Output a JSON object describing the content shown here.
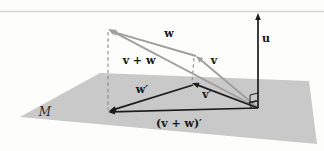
{
  "colors": {
    "background": "#fdfdfc",
    "plane_fill": "#c9c9c9",
    "gray_vector": "#9f9f9f",
    "black_vector": "#1c1c1c",
    "dashed_line": "#8c8c8c",
    "label": "#161616",
    "top_rule": "#d7d4d0"
  },
  "top_rule": {
    "y": 11.5
  },
  "plane": {
    "label": "M",
    "label_pos": [
      45,
      116
    ],
    "corners": [
      [
        20,
        117
      ],
      [
        100,
        73
      ],
      [
        309,
        81
      ],
      [
        317,
        144
      ]
    ]
  },
  "vectors": [
    {
      "id": "v-plus-w",
      "label": "v + w",
      "label_pos": [
        139,
        64
      ],
      "from": [
        258,
        108
      ],
      "to": [
        108,
        29
      ],
      "style": "gray"
    },
    {
      "id": "w",
      "label": "w",
      "label_pos": [
        169,
        37
      ],
      "from": [
        196,
        56
      ],
      "to": [
        110,
        31
      ],
      "style": "gray"
    },
    {
      "id": "v",
      "label": "v",
      "label_pos": [
        214,
        64
      ],
      "from": [
        258,
        108
      ],
      "to": [
        196,
        56
      ],
      "style": "gray"
    },
    {
      "id": "u",
      "label": "u",
      "label_pos": [
        266,
        42
      ],
      "from": [
        258,
        108
      ],
      "to": [
        258,
        13
      ],
      "style": "black"
    },
    {
      "id": "v-prime",
      "label": "v′",
      "label_pos": [
        207,
        98
      ],
      "from": [
        258,
        108
      ],
      "to": [
        192,
        83
      ],
      "style": "black"
    },
    {
      "id": "w-prime",
      "label": "w′",
      "label_pos": [
        142,
        93
      ],
      "from": [
        193,
        85
      ],
      "to": [
        109,
        111
      ],
      "style": "black"
    },
    {
      "id": "v-plus-w-prime",
      "label": "(v + w)′",
      "label_pos": [
        179,
        127
      ],
      "from": [
        258,
        108
      ],
      "to": [
        108,
        112
      ],
      "style": "black"
    }
  ],
  "dashed_lines": [
    {
      "id": "drop-line-left",
      "from": [
        108,
        32
      ],
      "to": [
        108,
        110
      ]
    },
    {
      "id": "drop-line-middle",
      "from": [
        194,
        58
      ],
      "to": [
        192,
        82
      ]
    }
  ],
  "right_angle_markers": [
    {
      "id": "marker-upper",
      "points": [
        [
          258,
          93
        ],
        [
          250,
          95
        ],
        [
          250,
          103
        ],
        [
          258,
          101
        ]
      ]
    },
    {
      "id": "marker-lower",
      "points": [
        [
          256.5,
          100.5
        ],
        [
          249,
          102.5
        ],
        [
          251.5,
          108
        ]
      ]
    }
  ]
}
